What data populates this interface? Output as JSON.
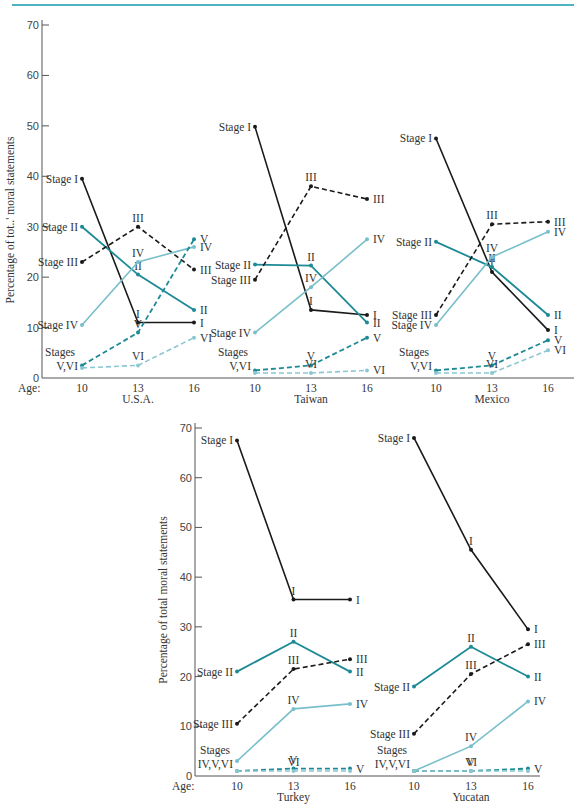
{
  "colors": {
    "stage1": "#1a1a1a",
    "stage2": "#1e8a96",
    "stage3": "#1a1a1a",
    "stage4": "#79bfcb",
    "stage5": "#1e8a96",
    "stage6": "#8cc7d1",
    "axis": "#555555",
    "rule": "#4fb3bf"
  },
  "chart_data": [
    {
      "type": "line",
      "title": "U.S.A.",
      "xlabel": "Age",
      "ylabel": "Percentage of total moral statements",
      "x": [
        10,
        13,
        16
      ],
      "ylim": [
        0,
        70
      ],
      "yticks": [
        0,
        10,
        20,
        30,
        40,
        50,
        60,
        70
      ],
      "series": [
        {
          "name": "Stage I",
          "values": [
            39.5,
            11,
            11
          ]
        },
        {
          "name": "Stage II",
          "values": [
            30,
            20.5,
            13.5
          ]
        },
        {
          "name": "Stage III",
          "values": [
            23,
            30,
            21.5
          ]
        },
        {
          "name": "Stage IV",
          "values": [
            10.5,
            23,
            26
          ]
        },
        {
          "name": "Stage V",
          "values": [
            2.5,
            9,
            27.5
          ]
        },
        {
          "name": "Stage VI",
          "values": [
            2,
            2.5,
            8
          ]
        }
      ]
    },
    {
      "type": "line",
      "title": "Taiwan",
      "x": [
        10,
        13,
        16
      ],
      "ylim": [
        0,
        70
      ],
      "series": [
        {
          "name": "Stage I",
          "values": [
            49.8,
            13.5,
            12.5
          ]
        },
        {
          "name": "Stage II",
          "values": [
            22.5,
            22.3,
            11
          ]
        },
        {
          "name": "Stage III",
          "values": [
            19.5,
            38,
            35.5
          ]
        },
        {
          "name": "Stage IV",
          "values": [
            9,
            18,
            27.5
          ]
        },
        {
          "name": "Stage V",
          "values": [
            1.5,
            2.5,
            8
          ]
        },
        {
          "name": "Stage VI",
          "values": [
            1,
            1,
            1.5
          ]
        }
      ]
    },
    {
      "type": "line",
      "title": "Mexico",
      "x": [
        10,
        13,
        16
      ],
      "ylim": [
        0,
        70
      ],
      "series": [
        {
          "name": "Stage I",
          "values": [
            47.5,
            21,
            9.5
          ]
        },
        {
          "name": "Stage II",
          "values": [
            27,
            22,
            12.5
          ]
        },
        {
          "name": "Stage III",
          "values": [
            12.5,
            30.5,
            31
          ]
        },
        {
          "name": "Stage IV",
          "values": [
            10.5,
            24,
            29
          ]
        },
        {
          "name": "Stage V",
          "values": [
            1.5,
            2.5,
            7.5
          ]
        },
        {
          "name": "Stage VI",
          "values": [
            1,
            1,
            5.5
          ]
        }
      ]
    },
    {
      "type": "line",
      "title": "Turkey",
      "xlabel": "Age",
      "ylabel": "Percentage of total moral statements",
      "x": [
        10,
        13,
        16
      ],
      "ylim": [
        0,
        70
      ],
      "yticks": [
        0,
        10,
        20,
        30,
        40,
        50,
        60,
        70
      ],
      "series": [
        {
          "name": "Stage I",
          "values": [
            67.5,
            35.5,
            35.5
          ]
        },
        {
          "name": "Stage II",
          "values": [
            21,
            27,
            21
          ]
        },
        {
          "name": "Stage III",
          "values": [
            10.5,
            21.5,
            23.5
          ]
        },
        {
          "name": "Stage IV",
          "values": [
            3,
            13.5,
            14.5
          ]
        },
        {
          "name": "Stage V",
          "values": [
            1,
            1.5,
            1.5
          ]
        },
        {
          "name": "Stage VI",
          "values": [
            1,
            1,
            1
          ]
        }
      ]
    },
    {
      "type": "line",
      "title": "Yucatan",
      "x": [
        10,
        13,
        16
      ],
      "ylim": [
        0,
        70
      ],
      "series": [
        {
          "name": "Stage I",
          "values": [
            68,
            45.5,
            29.5
          ]
        },
        {
          "name": "Stage II",
          "values": [
            18,
            26,
            20
          ]
        },
        {
          "name": "Stage III",
          "values": [
            8.5,
            20.5,
            26.5
          ]
        },
        {
          "name": "Stage IV",
          "values": [
            1,
            6,
            15
          ]
        },
        {
          "name": "Stage V",
          "values": [
            1,
            1,
            1.5
          ]
        },
        {
          "name": "Stage VI",
          "values": [
            1,
            1,
            1
          ]
        }
      ]
    }
  ],
  "labels": {
    "ylabel_top": "Percentage of tot..' moral statements",
    "ylabel_bottom": "Percentage of total moral statements",
    "age": "Age:",
    "stages_v_vi": [
      "Stages",
      "V,VI"
    ],
    "stages_iv_v_vi": [
      "Stages",
      "IV,V,VI"
    ]
  }
}
